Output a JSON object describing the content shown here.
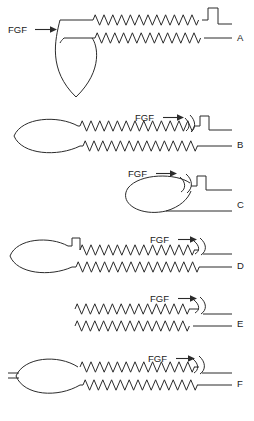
{
  "figure": {
    "type": "schematic-diagram",
    "panel_count": 6,
    "ligand_label": "FGF",
    "arrow_glyph": "→",
    "line_color": "#2b2b2b",
    "background_color": "#ffffff"
  },
  "panels": [
    {
      "id": "A",
      "letter": "A",
      "fgf_label": "FGF",
      "fgf_arrow": "→",
      "fgf_position": "left",
      "has_loop": true,
      "loop_shape": "vertical-teardrop",
      "has_notch": true,
      "notch_position": "right",
      "has_release_arc": false,
      "upper_strand_zigzag": true,
      "lower_strand_zigzag": true
    },
    {
      "id": "B",
      "letter": "B",
      "fgf_label": "FGF",
      "fgf_arrow": "→",
      "fgf_position": "right",
      "has_loop": true,
      "loop_shape": "horizontal-oval-left",
      "has_notch": true,
      "notch_position": "right",
      "has_release_arc": true,
      "upper_strand_zigzag": true,
      "lower_strand_zigzag": true
    },
    {
      "id": "C",
      "letter": "C",
      "fgf_label": "FGF",
      "fgf_arrow": "→",
      "fgf_position": "right",
      "has_loop": true,
      "loop_shape": "horizontal-oval-right",
      "has_notch": true,
      "notch_position": "right",
      "has_release_arc": true,
      "upper_strand_zigzag": false,
      "lower_strand_zigzag": false
    },
    {
      "id": "D",
      "letter": "D",
      "fgf_label": "FGF",
      "fgf_arrow": "→",
      "fgf_position": "right",
      "has_loop": true,
      "loop_shape": "horizontal-oval-left",
      "has_notch": true,
      "notch_position": "left",
      "has_release_arc": true,
      "upper_strand_zigzag": true,
      "lower_strand_zigzag": true
    },
    {
      "id": "E",
      "letter": "E",
      "fgf_label": "FGF",
      "fgf_arrow": "→",
      "fgf_position": "right",
      "has_loop": false,
      "loop_shape": "none",
      "has_notch": false,
      "notch_position": "none",
      "has_release_arc": true,
      "upper_strand_zigzag": true,
      "lower_strand_zigzag": true
    },
    {
      "id": "F",
      "letter": "F",
      "fgf_label": "FGF",
      "fgf_arrow": "→",
      "fgf_position": "right",
      "has_loop": true,
      "loop_shape": "horizontal-oval-left-ticked",
      "has_notch": false,
      "notch_position": "none",
      "has_release_arc": true,
      "upper_strand_zigzag": true,
      "lower_strand_zigzag": true
    }
  ]
}
